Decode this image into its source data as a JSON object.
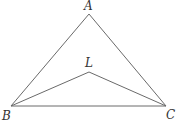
{
  "diagram": {
    "type": "geometry",
    "points": [
      {
        "id": "A",
        "label": "A",
        "x": 89,
        "y": 14,
        "label_x": 84,
        "label_y": 10
      },
      {
        "id": "B",
        "label": "B",
        "x": 11,
        "y": 106,
        "label_x": 2,
        "label_y": 120
      },
      {
        "id": "C",
        "label": "C",
        "x": 166,
        "y": 106,
        "label_x": 166,
        "label_y": 119
      },
      {
        "id": "L",
        "label": "L",
        "x": 89,
        "y": 72,
        "label_x": 85,
        "label_y": 67
      }
    ],
    "segments": [
      {
        "from": "A",
        "to": "B"
      },
      {
        "from": "A",
        "to": "C"
      },
      {
        "from": "B",
        "to": "C"
      },
      {
        "from": "B",
        "to": "L"
      },
      {
        "from": "L",
        "to": "C"
      }
    ],
    "line_color": "#6a6a6a"
  }
}
